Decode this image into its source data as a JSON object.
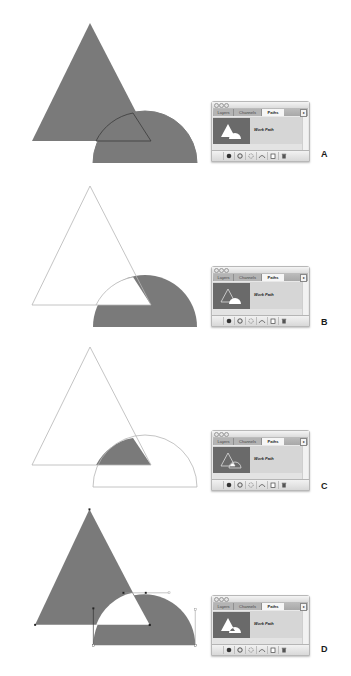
{
  "shape_colors": {
    "fill": "#7a7a7a",
    "outline": "#b5b5b5",
    "anchor": "#222222",
    "handle_line": "#9a9a9a"
  },
  "palette": {
    "tabs": [
      "Layers",
      "Channels",
      "Paths"
    ],
    "active_tab": "Paths",
    "flyout_icon": "triangle-right-icon",
    "path_name": "Work Path",
    "bottom_icons": [
      "fill-path-icon",
      "stroke-path-icon",
      "load-selection-icon",
      "make-work-path-icon",
      "new-path-icon",
      "delete-path-icon"
    ]
  },
  "figures": [
    {
      "label": "A",
      "mode": "add",
      "description": "Combined shape: triangle and semicircle filled with overlap outline visible"
    },
    {
      "label": "B",
      "mode": "subtract",
      "description": "Semicircle minus triangle filled; triangle shown as outline"
    },
    {
      "label": "C",
      "mode": "intersect",
      "description": "Only the intersection of triangle and semicircle is filled"
    },
    {
      "label": "D",
      "mode": "exclude",
      "description": "Exclude overlapping area; anchor points and handles visible"
    }
  ]
}
